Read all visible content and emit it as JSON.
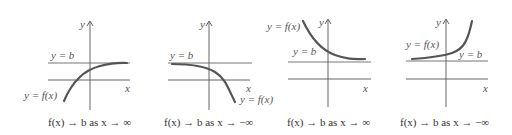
{
  "figure": {
    "panels": [
      {
        "id": "p1",
        "function_label": "y = f(x)",
        "asymptote_label": "y = b",
        "y_axis_label": "y",
        "x_axis_label": "x",
        "caption": "f(x) → b as x → ∞",
        "behavior": "increasing toward b from below"
      },
      {
        "id": "p2",
        "function_label": "y = f(x)",
        "asymptote_label": "y = b",
        "y_axis_label": "y",
        "x_axis_label": "x",
        "caption": "f(x) → b as x → −∞",
        "behavior": "decreasing away from b"
      },
      {
        "id": "p3",
        "function_label": "y = f(x)",
        "asymptote_label": "y = b",
        "y_axis_label": "y",
        "x_axis_label": "x",
        "caption": "f(x) → b as x → ∞",
        "behavior": "decreasing toward b from above"
      },
      {
        "id": "p4",
        "function_label": "y = f(x)",
        "asymptote_label": "y = b",
        "y_axis_label": "y",
        "x_axis_label": "x",
        "caption": "f(x) → b as x → −∞",
        "behavior": "increasing away from b"
      }
    ],
    "colors": {
      "curve": "#555555",
      "axis": "#555555",
      "text": "#333333"
    }
  }
}
